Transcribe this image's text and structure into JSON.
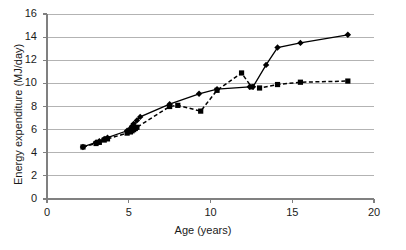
{
  "chart_data": {
    "type": "line",
    "title": "",
    "xlabel": "Age (years)",
    "ylabel": "Energy expenditure (MJ/day)",
    "xlim": [
      0,
      20
    ],
    "ylim": [
      0,
      16
    ],
    "xticks": [
      0,
      5,
      10,
      15,
      20
    ],
    "yticks": [
      0,
      2,
      4,
      6,
      8,
      10,
      12,
      14,
      16
    ],
    "grid": "horizontal",
    "legend": "none",
    "series": [
      {
        "name": "solid-diamond-series",
        "marker": "diamond",
        "linestyle": "solid",
        "color": "#000000",
        "points": [
          [
            2.2,
            4.5
          ],
          [
            3.0,
            4.9
          ],
          [
            3.2,
            5.0
          ],
          [
            3.5,
            5.2
          ],
          [
            3.7,
            5.3
          ],
          [
            4.9,
            5.9
          ],
          [
            5.1,
            6.1
          ],
          [
            5.2,
            6.3
          ],
          [
            5.3,
            6.5
          ],
          [
            5.5,
            6.8
          ],
          [
            5.7,
            7.1
          ],
          [
            7.5,
            8.2
          ],
          [
            9.3,
            9.1
          ],
          [
            10.4,
            9.5
          ],
          [
            12.4,
            9.7
          ],
          [
            12.6,
            9.7
          ],
          [
            13.4,
            11.6
          ],
          [
            14.1,
            13.1
          ],
          [
            15.5,
            13.5
          ],
          [
            18.4,
            14.2
          ]
        ]
      },
      {
        "name": "dashed-square-series",
        "marker": "square",
        "linestyle": "dashed",
        "color": "#000000",
        "points": [
          [
            2.2,
            4.5
          ],
          [
            3.0,
            4.8
          ],
          [
            3.2,
            4.9
          ],
          [
            3.5,
            5.1
          ],
          [
            3.7,
            5.2
          ],
          [
            4.9,
            5.7
          ],
          [
            5.1,
            5.8
          ],
          [
            5.2,
            5.9
          ],
          [
            5.3,
            6.0
          ],
          [
            5.4,
            6.1
          ],
          [
            5.5,
            6.2
          ],
          [
            7.5,
            8.0
          ],
          [
            8.0,
            8.1
          ],
          [
            9.4,
            7.6
          ],
          [
            10.4,
            9.4
          ],
          [
            11.9,
            10.9
          ],
          [
            12.5,
            9.7
          ],
          [
            13.0,
            9.6
          ],
          [
            14.1,
            9.9
          ],
          [
            15.5,
            10.1
          ],
          [
            18.4,
            10.2
          ]
        ]
      }
    ]
  },
  "axes": {
    "y_tick_labels": [
      "0",
      "2",
      "4",
      "6",
      "8",
      "10",
      "12",
      "14",
      "16"
    ],
    "x_tick_labels": [
      "0",
      "5",
      "10",
      "15",
      "20"
    ]
  }
}
